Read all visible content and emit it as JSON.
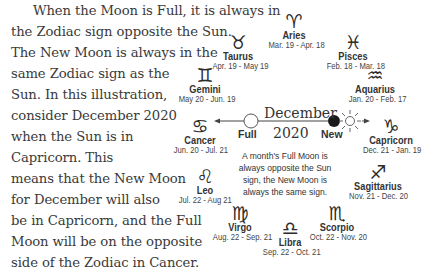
{
  "paragraph": {
    "lines": [
      "When the Moon is Full, it is always in",
      "the Zodiac sign opposite the Sun.",
      "The New Moon is always in the",
      "same Zodiac sign as the",
      "Sun.  In this illustration,",
      "consider December 2020",
      "when the Sun is in",
      "Capricorn.  This",
      "means that the New Moon",
      "for December will also",
      "be in Capricorn, and the Full",
      "Moon will be on the opposite",
      "side of the Zodiac in Cancer."
    ]
  },
  "diagram": {
    "month": "December",
    "year": "2020",
    "full_label": "Full",
    "new_label": "New",
    "caption": "A month's Full Moon is always opposite the Sun sign, the New Moon is always the same sign.",
    "signs": {
      "aries": {
        "glyph": "♈",
        "name": "Aries",
        "dates": "Mar. 19 - Apr. 18"
      },
      "taurus": {
        "glyph": "♉",
        "name": "Taurus",
        "dates": "Apr. 19 - May 19"
      },
      "gemini": {
        "glyph": "♊",
        "name": "Gemini",
        "dates": "May 20 - Jun. 19"
      },
      "cancer": {
        "glyph": "♋",
        "name": "Cancer",
        "dates": "Jun. 20 - Jul. 21"
      },
      "leo": {
        "glyph": "♌",
        "name": "Leo",
        "dates": "Jul. 22 - Aug 21"
      },
      "virgo": {
        "glyph": "♍",
        "name": "Virgo",
        "dates": "Aug. 22 - Sep. 21"
      },
      "libra": {
        "glyph": "♎",
        "name": "Libra",
        "dates": "Sep. 22 - Oct. 21"
      },
      "scorpio": {
        "glyph": "♏",
        "name": "Scorpio",
        "dates": "Oct. 22 - Nov. 20"
      },
      "sagittarius": {
        "glyph": "♐",
        "name": "Sagittarius",
        "dates": "Nov. 21 - Dec. 20"
      },
      "capricorn": {
        "glyph": "♑",
        "name": "Capricorn",
        "dates": "Dec. 21 - Jan. 19"
      },
      "aquarius": {
        "glyph": "♒",
        "name": "Aquarius",
        "dates": "Jan. 20 - Feb. 17"
      },
      "pisces": {
        "glyph": "♓",
        "name": "Pisces",
        "dates": "Feb. 18 - Mar. 18"
      }
    }
  }
}
